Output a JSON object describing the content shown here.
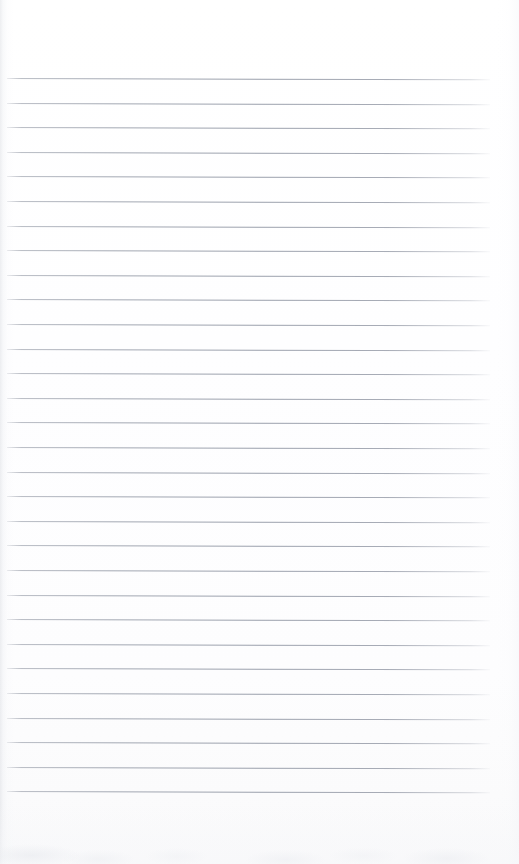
{
  "document": {
    "type": "scanned-ruled-notebook-page",
    "title": "Blank Ruled Notebook Page",
    "page_width": 519,
    "page_height": 864,
    "background_color": "#ffffff",
    "content_text": "",
    "has_handwriting": false,
    "has_printed_text": false
  },
  "ruling": {
    "line_color": "#9298a5",
    "line_count": 30,
    "first_line_y": 78,
    "line_spacing": 24.6,
    "line_start_x": 7,
    "line_end_x": 490,
    "line_thickness": 1,
    "tilt_degrees": 0.16,
    "lines_y": [
      78,
      102.6,
      127.2,
      151.8,
      176.4,
      201,
      225.6,
      250.2,
      274.8,
      299.4,
      324,
      348.6,
      373.2,
      397.8,
      422.4,
      447,
      471.6,
      496.2,
      520.8,
      545.4,
      570,
      594.6,
      619.2,
      643.8,
      668.4,
      693,
      717.6,
      742.2,
      766.8,
      791.4
    ]
  },
  "margins": {
    "top_margin": 78,
    "bottom_margin": 73,
    "left_margin": 7,
    "right_margin": 29
  },
  "scan_artifacts": {
    "left_edge_shadow_color": "#c4c8d0",
    "right_edge_shadow_color": "#eef0f5",
    "bottom_smudge_color": "#e2e5eb",
    "paper_tint": "#fdfdfe"
  }
}
